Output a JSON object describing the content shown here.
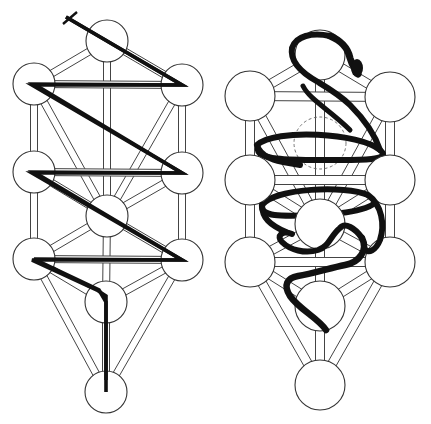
{
  "figure": {
    "background": "#ffffff",
    "ink": "#111111"
  },
  "trees": [
    {
      "id": "lightning-flash-tree",
      "overlay": "lightning flash (zig-zag descending path) with cross at the top",
      "node_radius": 21,
      "nodes": [
        {
          "name": "kether",
          "x": 107,
          "y": 41
        },
        {
          "name": "chokmah",
          "x": 182,
          "y": 85
        },
        {
          "name": "binah",
          "x": 34,
          "y": 84
        },
        {
          "name": "chesed",
          "x": 182,
          "y": 173
        },
        {
          "name": "geburah",
          "x": 34,
          "y": 172
        },
        {
          "name": "tiphareth",
          "x": 107,
          "y": 216
        },
        {
          "name": "netzach",
          "x": 182,
          "y": 260
        },
        {
          "name": "hod",
          "x": 34,
          "y": 259
        },
        {
          "name": "yesod",
          "x": 106,
          "y": 302
        },
        {
          "name": "malkuth",
          "x": 106,
          "y": 392
        }
      ]
    },
    {
      "id": "serpent-tree",
      "overlay": "serpent coiling upward around the paths, head at top near Kether; dashed circle marks Daath",
      "node_radius": 25,
      "nodes": [
        {
          "name": "kether",
          "x": 320,
          "y": 55
        },
        {
          "name": "chokmah",
          "x": 390,
          "y": 97
        },
        {
          "name": "binah",
          "x": 250,
          "y": 96
        },
        {
          "name": "chesed",
          "x": 390,
          "y": 180
        },
        {
          "name": "geburah",
          "x": 250,
          "y": 180
        },
        {
          "name": "tiphareth",
          "x": 320,
          "y": 224
        },
        {
          "name": "netzach",
          "x": 390,
          "y": 262
        },
        {
          "name": "hod",
          "x": 250,
          "y": 262
        },
        {
          "name": "yesod",
          "x": 320,
          "y": 306
        },
        {
          "name": "malkuth",
          "x": 320,
          "y": 385
        }
      ],
      "daath": {
        "x": 320,
        "y": 142,
        "r": 26
      }
    }
  ],
  "paths": [
    [
      "kether",
      "chokmah"
    ],
    [
      "kether",
      "binah"
    ],
    [
      "kether",
      "tiphareth"
    ],
    [
      "chokmah",
      "binah"
    ],
    [
      "chokmah",
      "chesed"
    ],
    [
      "chokmah",
      "tiphareth"
    ],
    [
      "binah",
      "geburah"
    ],
    [
      "binah",
      "tiphareth"
    ],
    [
      "chesed",
      "geburah"
    ],
    [
      "chesed",
      "tiphareth"
    ],
    [
      "chesed",
      "netzach"
    ],
    [
      "geburah",
      "tiphareth"
    ],
    [
      "geburah",
      "hod"
    ],
    [
      "tiphareth",
      "netzach"
    ],
    [
      "tiphareth",
      "hod"
    ],
    [
      "tiphareth",
      "yesod"
    ],
    [
      "netzach",
      "hod"
    ],
    [
      "netzach",
      "yesod"
    ],
    [
      "netzach",
      "malkuth"
    ],
    [
      "hod",
      "yesod"
    ],
    [
      "hod",
      "malkuth"
    ],
    [
      "yesod",
      "malkuth"
    ]
  ]
}
